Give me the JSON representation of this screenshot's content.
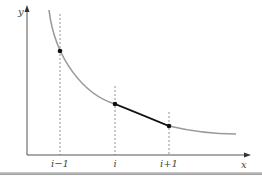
{
  "diagram": {
    "axes": {
      "x_label": "x",
      "y_label": "y",
      "color": "#555555"
    },
    "curve": {
      "description": "decreasing convex curve",
      "color": "#9a9a9a",
      "path": "M49,10 C55,60 85,95 115,104 C140,113 160,123 169,126 C190,131 215,134 236,134"
    },
    "ticks": [
      {
        "label": "i−1",
        "x": 60
      },
      {
        "label": "i",
        "x": 115
      },
      {
        "label": "i+1",
        "x": 169
      }
    ],
    "points": [
      {
        "name": "point-i-minus-1",
        "x": 60,
        "y": 51
      },
      {
        "name": "point-i",
        "x": 115,
        "y": 104
      },
      {
        "name": "point-i-plus-1",
        "x": 169,
        "y": 126
      }
    ],
    "secant": {
      "from": [
        115,
        104
      ],
      "to": [
        169,
        126
      ],
      "color": "#111111"
    },
    "colors": {
      "dashed": "#777777",
      "point": "#111111"
    }
  }
}
